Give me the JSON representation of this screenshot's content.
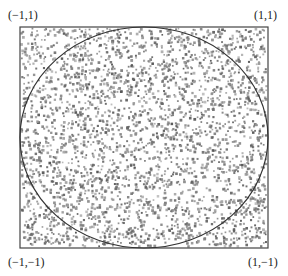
{
  "figure": {
    "corner_labels": {
      "top_left": "(−1,1)",
      "top_right": "(1,1)",
      "bottom_left": "(−1,−1)",
      "bottom_right": "(1,−1)"
    },
    "square": {
      "x_range": [
        -1,
        1
      ],
      "y_range": [
        -1,
        1
      ],
      "stroke_color": "#444444"
    },
    "circle": {
      "center": [
        0,
        0
      ],
      "radius": 1,
      "stroke_color": "#333333"
    },
    "points": {
      "count": 3000,
      "color_range": [
        "#9a9a9a",
        "#555555"
      ],
      "marker": "small-dot"
    }
  }
}
